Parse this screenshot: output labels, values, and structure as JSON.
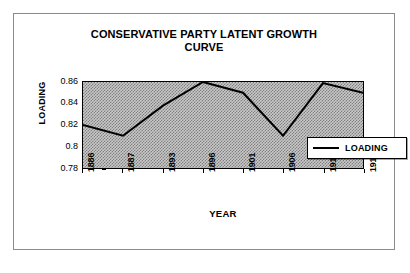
{
  "chart_data": {
    "type": "line",
    "title": "CONSERVATIVE PARTY LATENT GROWTH CURVE",
    "title_lines": [
      "CONSERVATIVE PARTY LATENT GROWTH",
      "CURVE"
    ],
    "xlabel": "YEAR",
    "ylabel": "LOADING",
    "categories": [
      "1886",
      "1887",
      "1893",
      "1896",
      "1901",
      "1906",
      "1910",
      "1911"
    ],
    "series": [
      {
        "name": "LOADING",
        "values": [
          0.82,
          0.81,
          0.838,
          0.86,
          0.85,
          0.81,
          0.859,
          0.85
        ],
        "color": "#000000"
      }
    ],
    "ylim": [
      0.78,
      0.86
    ],
    "ytick_labels": [
      "0.86",
      "0.84",
      "0.82",
      "0.8",
      "0.78"
    ],
    "ytick_values": [
      0.86,
      0.84,
      0.82,
      0.8,
      0.78
    ],
    "grid": false,
    "legend": {
      "position": "bottom-right",
      "entries": [
        {
          "label": "LOADING",
          "swatch": "line-swatch"
        }
      ]
    },
    "plot_background": "#c9c9c9",
    "frame_color": "#8a8a8a"
  }
}
